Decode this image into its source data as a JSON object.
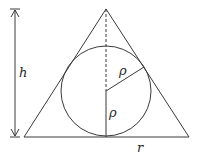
{
  "diagram": {
    "colors": {
      "stroke": "#3a3a3a",
      "background": "#ffffff"
    },
    "labels": {
      "height": "h",
      "base_half": "r",
      "radius_upper": "ρ",
      "radius_lower": "ρ"
    },
    "geometry": {
      "apex": [
        106,
        9
      ],
      "base_left": [
        24,
        137
      ],
      "base_right": [
        189,
        137
      ],
      "circle_center": [
        106,
        91
      ],
      "circle_radius": 45,
      "height_arrow_x": 15
    }
  }
}
